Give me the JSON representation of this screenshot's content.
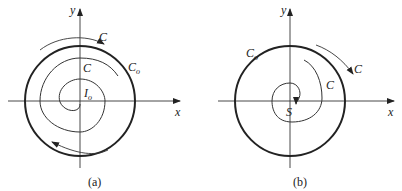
{
  "panels": [
    {
      "id": "a",
      "caption": "(a)",
      "axis_x_label": "x",
      "axis_y_label": "y",
      "outer_curve_label": "C",
      "outer_curve_sub": "o",
      "trajectory_label": "C",
      "outer_arrow_label": "C",
      "center_label": "I",
      "center_sub": "o",
      "description": "Unstable focus I_o with trajectory C spiraling outward toward limit cycle C_o"
    },
    {
      "id": "b",
      "caption": "(b)",
      "axis_x_label": "x",
      "axis_y_label": "y",
      "outer_curve_label": "C",
      "outer_curve_sub": "o",
      "trajectory_label": "C",
      "outer_arrow_label": "C",
      "center_label": "S",
      "description": "Stable focus S with trajectory C spiraling inward inside cycle C_o"
    }
  ],
  "colors": {
    "stroke": "#222222",
    "background": "#ffffff"
  }
}
